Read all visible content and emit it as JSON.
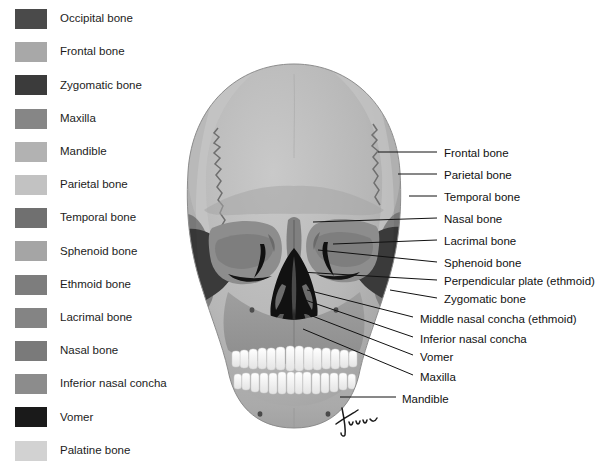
{
  "figure": {
    "signature": "Tina",
    "background_color": "#ffffff",
    "text_color": "#111111"
  },
  "legend": {
    "items": [
      {
        "label": "Occipital bone",
        "color": "#4a4a4a"
      },
      {
        "label": "Frontal bone",
        "color": "#a8a8a8"
      },
      {
        "label": "Zygomatic bone",
        "color": "#3b3b3b"
      },
      {
        "label": "Maxilla",
        "color": "#868686"
      },
      {
        "label": "Mandible",
        "color": "#b2b2b2"
      },
      {
        "label": "Parietal bone",
        "color": "#c2c2c2"
      },
      {
        "label": "Temporal bone",
        "color": "#707070"
      },
      {
        "label": "Sphenoid bone",
        "color": "#a5a5a5"
      },
      {
        "label": "Ethmoid bone",
        "color": "#7d7d7d"
      },
      {
        "label": "Lacrimal bone",
        "color": "#848484"
      },
      {
        "label": "Nasal bone",
        "color": "#7a7a7a"
      },
      {
        "label": "Inferior nasal concha",
        "color": "#8c8c8c"
      },
      {
        "label": "Vomer",
        "color": "#1a1a1a"
      },
      {
        "label": "Palatine bone",
        "color": "#d2d2d2"
      }
    ]
  },
  "callouts": {
    "items": [
      {
        "label": "Frontal bone",
        "text_x": 444,
        "text_y": 148,
        "line_x1": 378,
        "line_y1": 152,
        "line_x2": 437,
        "line_y2": 152
      },
      {
        "label": "Parietal bone",
        "text_x": 444,
        "text_y": 170,
        "line_x1": 398,
        "line_y1": 174,
        "line_x2": 437,
        "line_y2": 174
      },
      {
        "label": "Temporal bone",
        "text_x": 444,
        "text_y": 192,
        "line_x1": 409,
        "line_y1": 196,
        "line_x2": 437,
        "line_y2": 196
      },
      {
        "label": "Nasal bone",
        "text_x": 444,
        "text_y": 214,
        "line_x1": 313,
        "line_y1": 222,
        "line_x2": 437,
        "line_y2": 218
      },
      {
        "label": "Lacrimal bone",
        "text_x": 444,
        "text_y": 236,
        "line_x1": 333,
        "line_y1": 244,
        "line_x2": 437,
        "line_y2": 240
      },
      {
        "label": "Sphenoid bone",
        "text_x": 444,
        "text_y": 258,
        "line_x1": 318,
        "line_y1": 250,
        "line_x2": 437,
        "line_y2": 262
      },
      {
        "label": "Perpendicular plate (ethmoid)",
        "text_x": 444,
        "text_y": 276,
        "line_x1": 300,
        "line_y1": 272,
        "line_x2": 437,
        "line_y2": 280
      },
      {
        "label": "Zygomatic bone",
        "text_x": 444,
        "text_y": 294,
        "line_x1": 390,
        "line_y1": 290,
        "line_x2": 437,
        "line_y2": 298
      },
      {
        "label": "Middle nasal concha (ethmoid)",
        "text_x": 420,
        "text_y": 314,
        "line_x1": 307,
        "line_y1": 290,
        "line_x2": 413,
        "line_y2": 317
      },
      {
        "label": "Inferior nasal concha",
        "text_x": 420,
        "text_y": 334,
        "line_x1": 305,
        "line_y1": 300,
        "line_x2": 413,
        "line_y2": 337
      },
      {
        "label": "Vomer",
        "text_x": 420,
        "text_y": 352,
        "line_x1": 302,
        "line_y1": 312,
        "line_x2": 413,
        "line_y2": 355
      },
      {
        "label": "Maxilla",
        "text_x": 420,
        "text_y": 372,
        "line_x1": 303,
        "line_y1": 329,
        "line_x2": 413,
        "line_y2": 375
      },
      {
        "label": "Mandible",
        "text_x": 402,
        "text_y": 394,
        "line_x1": 340,
        "line_y1": 397,
        "line_x2": 396,
        "line_y2": 397
      }
    ]
  },
  "skull": {
    "palette": {
      "cranium_frontal": "#b5b5b5",
      "cranium_parietal": "#bfbfbf",
      "cranium_shadow": "#a4a4a4",
      "temporal": "#8f8f8f",
      "zygomatic_dark": "#3c3c3c",
      "orbit_mid": "#8b8b8b",
      "orbit_deep": "#6e6e6e",
      "nasal_cavity": "#111111",
      "maxilla": "#9b9b9b",
      "mandible": "#aeaeae",
      "teeth": "#fbfbfb",
      "suture": "#6b6b6b",
      "outline": "#7a7a7a"
    }
  }
}
